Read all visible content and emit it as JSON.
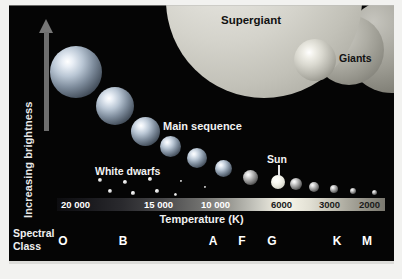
{
  "figure": {
    "type": "hertzsprung-russell-diagram",
    "background_color": "#050505"
  },
  "axes": {
    "y_label": "Increasing brightness",
    "x_title": "Temperature (K)",
    "spectral_title_line1": "Spectral",
    "spectral_title_line2": "Class"
  },
  "labels": {
    "supergiant": "Supergiant",
    "giants": "Giants",
    "main_sequence": "Main sequence",
    "white_dwarfs": "White dwarfs",
    "sun": "Sun"
  },
  "chart_data": {
    "type": "scatter",
    "title": "",
    "xlabel": "Temperature (K)",
    "ylabel": "Increasing brightness",
    "grid": false,
    "legend": "none",
    "x_axis_reversed": true,
    "temperature_ticks": [
      {
        "label": "20 000",
        "x_px": 52,
        "dark_text": false
      },
      {
        "label": "15 000",
        "x_px": 135,
        "dark_text": false
      },
      {
        "label": "10 000",
        "x_px": 192,
        "dark_text": false
      },
      {
        "label": "6000",
        "x_px": 262,
        "dark_text": true
      },
      {
        "label": "3000",
        "x_px": 310,
        "dark_text": true
      },
      {
        "label": "2000",
        "x_px": 350,
        "dark_text": true
      }
    ],
    "spectral_classes": [
      {
        "label": "O",
        "x_px": 54
      },
      {
        "label": "B",
        "x_px": 114
      },
      {
        "label": "A",
        "x_px": 204
      },
      {
        "label": "F",
        "x_px": 233
      },
      {
        "label": "G",
        "x_px": 263
      },
      {
        "label": "K",
        "x_px": 328
      },
      {
        "label": "M",
        "x_px": 358
      }
    ],
    "series": [
      {
        "name": "Main sequence",
        "points": [
          {
            "cx": 67,
            "cy": 67,
            "r": 26,
            "style": "ms-star"
          },
          {
            "cx": 106,
            "cy": 101,
            "r": 19,
            "style": "ms-star"
          },
          {
            "cx": 136,
            "cy": 126,
            "r": 14.5,
            "style": "ms-star"
          },
          {
            "cx": 161,
            "cy": 141,
            "r": 10.5,
            "style": "ms-star"
          },
          {
            "cx": 188,
            "cy": 153,
            "r": 10,
            "style": "ms-star"
          },
          {
            "cx": 214,
            "cy": 163,
            "r": 8.5,
            "style": "ms-star"
          },
          {
            "cx": 241,
            "cy": 172,
            "r": 7.5,
            "style": "ms-star-cool"
          },
          {
            "cx": 287,
            "cy": 179,
            "r": 6,
            "style": "ms-star-cool"
          },
          {
            "cx": 305,
            "cy": 182,
            "r": 5,
            "style": "ms-star-cool"
          },
          {
            "cx": 325,
            "cy": 184,
            "r": 4,
            "style": "ms-star-cool"
          },
          {
            "cx": 344,
            "cy": 186,
            "r": 3,
            "style": "ms-star-cool"
          },
          {
            "cx": 365,
            "cy": 187,
            "r": 2.5,
            "style": "ms-star-cool"
          }
        ]
      },
      {
        "name": "Sun",
        "points": [
          {
            "cx": 269,
            "cy": 177,
            "r": 7,
            "style": "sun-star"
          }
        ]
      },
      {
        "name": "White dwarfs",
        "points": [
          {
            "cx": 91,
            "cy": 175,
            "r": 2.0,
            "style": "dwarf"
          },
          {
            "cx": 116,
            "cy": 177,
            "r": 1.8,
            "style": "dwarf"
          },
          {
            "cx": 141,
            "cy": 174,
            "r": 1.7,
            "style": "dwarf"
          },
          {
            "cx": 101,
            "cy": 186,
            "r": 1.9,
            "style": "dwarf"
          },
          {
            "cx": 124,
            "cy": 188,
            "r": 1.6,
            "style": "dwarf"
          },
          {
            "cx": 148,
            "cy": 186,
            "r": 1.7,
            "style": "dwarf"
          },
          {
            "cx": 166,
            "cy": 189,
            "r": 1.5,
            "style": "dwarf"
          },
          {
            "cx": 172,
            "cy": 176,
            "r": 1.3,
            "style": "dwarf"
          },
          {
            "cx": 196,
            "cy": 182,
            "r": 1.2,
            "style": "dwarf"
          }
        ]
      },
      {
        "name": "Supergiant",
        "points": [
          {
            "cx": 255,
            "cy": -5,
            "r": 98,
            "style": "supergiant-body"
          }
        ]
      },
      {
        "name": "Giants",
        "points": [
          {
            "cx": 383,
            "cy": 41,
            "r": 47,
            "style": "giant-dark"
          },
          {
            "cx": 340,
            "cy": 45,
            "r": 35,
            "style": "giant-mid"
          },
          {
            "cx": 306,
            "cy": 55,
            "r": 21,
            "style": "giant-bright"
          }
        ]
      }
    ]
  }
}
